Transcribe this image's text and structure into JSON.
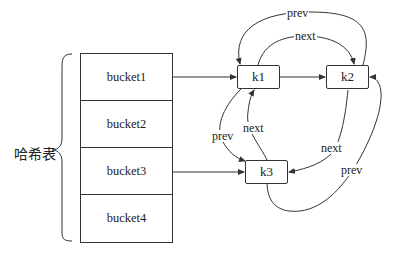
{
  "hash_table": {
    "label": "哈希表",
    "buckets": [
      "bucket1",
      "bucket2",
      "bucket3",
      "bucket4"
    ]
  },
  "nodes": {
    "k1": "k1",
    "k2": "k2",
    "k3": "k3"
  },
  "edges": {
    "k2_to_k1_prev": "prev",
    "k1_to_k2_next": "next",
    "k1_to_k3_prev": "prev",
    "k3_to_k1_next": "next",
    "k2_to_k3_next": "next",
    "k3_to_k2_prev": "prev"
  },
  "colors": {
    "stroke": "#333333",
    "background": "#ffffff"
  }
}
